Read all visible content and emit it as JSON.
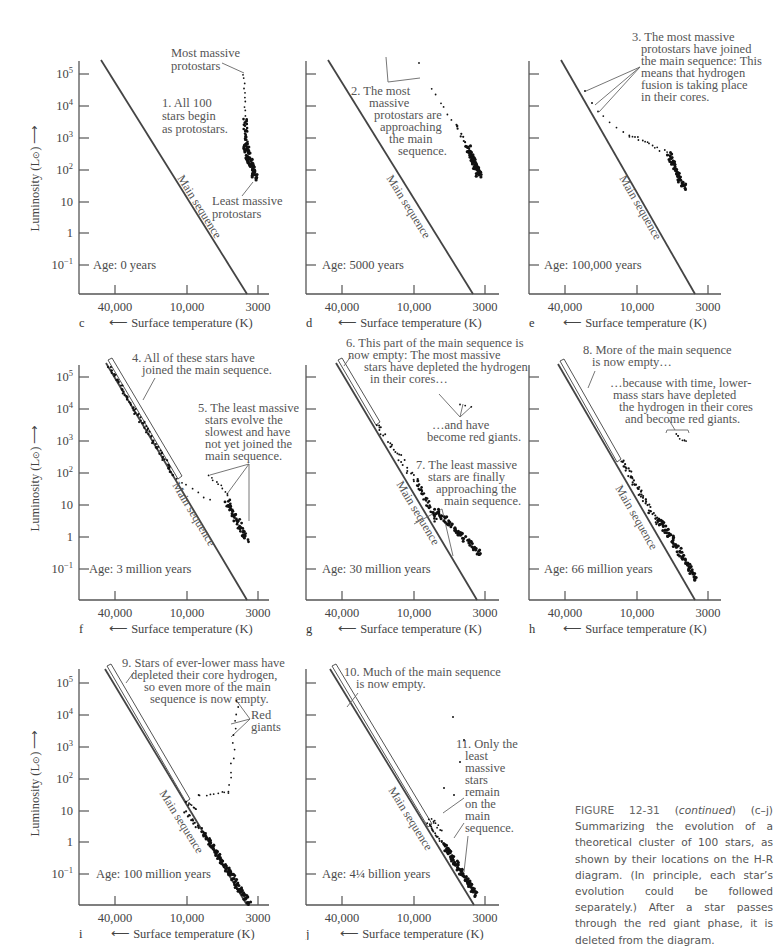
{
  "figure": {
    "caption": {
      "figure_number": "FIGURE 12-31",
      "continued": "continued",
      "text": "(c–j) Summarizing the evolution of a theoretical cluster of 100 stars, as shown by their locations on the H-R diagram. (In principle, each star’s evolution could be followed separately.) After a star passes through the red giant phase, it is deleted from the diagram."
    },
    "axes": {
      "y_label": "Luminosity (L⊙)",
      "x_label": "Surface temperature (K)",
      "y_ticks": [
        "10^5",
        "10^4",
        "10^3",
        "10^2",
        "10",
        "1",
        "10^-1"
      ],
      "x_ticks": [
        "40,000",
        "10,000",
        "3000"
      ],
      "main_sequence_label": "Main sequence"
    },
    "colors": {
      "ink": "#444444",
      "stars": "#111111",
      "text": "#4a4a4a",
      "background": "#ffffff"
    }
  },
  "chart_data": [
    {
      "panel": "c",
      "type": "scatter",
      "age": "Age: 0 years",
      "xlabel": "Surface temperature (K)",
      "ylabel": "Luminosity (L⊙)",
      "x_ticks": [
        40000,
        10000,
        3000
      ],
      "y_ticks": [
        100000,
        10000,
        1000,
        100,
        10,
        1,
        0.1
      ],
      "annotations": [
        "Most massive protostars",
        "1. All 100 stars begin as protostars.",
        "Least massive protostars"
      ],
      "stars_description": "vertical column near T≈3000 K from L≈100000 down to L≈50"
    },
    {
      "panel": "d",
      "type": "scatter",
      "age": "Age: 5000 years",
      "annotations": [
        "2. The most massive protostars are approaching the main sequence."
      ],
      "stars_description": "curve from T≈7000 K, L≈30000 descending to T≈2900 K, L≈60"
    },
    {
      "panel": "e",
      "type": "scatter",
      "age": "Age: 100,000 years",
      "annotations": [
        "3. The most massive protostars have joined the main sequence: This means that hydrogen fusion is taking place in their cores."
      ],
      "stars_description": "few stars on main sequence at L≈10^4; track across to T≈3000 K, L≈5"
    },
    {
      "panel": "f",
      "type": "scatter",
      "age": "Age: 3 million years",
      "annotations": [
        "4. All of these stars have joined the main sequence.",
        "5. The least massive stars evolve the slowest and have not yet joined the main sequence."
      ],
      "stars_description": "main sequence populated from L≈10^5 to ≈50; low-mass stars off MS down to L≈0.2"
    },
    {
      "panel": "g",
      "type": "scatter",
      "age": "Age: 30 million years",
      "annotations": [
        "6. This part of the main sequence is now empty: The most massive stars have depleted the hydrogen in their cores…",
        "…and have become red giants.",
        "7. The least massive stars are finally approaching the main sequence."
      ],
      "stars_description": "upper MS empty above L≈3000; few red giants; MS populated down to L≈0.2"
    },
    {
      "panel": "h",
      "type": "scatter",
      "age": "Age: 66 million years",
      "annotations": [
        "8. More of the main sequence is now empty…",
        "…because with time, lower-mass stars have depleted the hydrogen in their cores and become red giants."
      ],
      "stars_description": "MS empty above L≈200; red giants cluster near L≈50"
    },
    {
      "panel": "i",
      "type": "scatter",
      "age": "Age: 100 million years",
      "annotations": [
        "9. Stars of ever-lower mass have depleted their core hydrogen, so even more of the main sequence is now empty.",
        "Red giants"
      ],
      "stars_description": "MS empty above L≈20; giant branch rising to L≈2000 near T≈3500 K"
    },
    {
      "panel": "j",
      "type": "scatter",
      "age": "Age: 4¼ billion years",
      "annotations": [
        "10. Much of the main sequence is now empty.",
        "11. Only the least massive stars remain on the main sequence."
      ],
      "stars_description": "MS occupied only below L≈1; scattered giants"
    }
  ],
  "panels": {
    "c": {
      "letter": "c",
      "age": "Age: 0 years",
      "notes": [
        "Most massive",
        "protostars",
        "1. All 100",
        "stars begin",
        "as protostars.",
        "Least massive",
        "protostars"
      ]
    },
    "d": {
      "letter": "d",
      "age": "Age: 5000 years",
      "notes": [
        "2. The most",
        "massive",
        "protostars are",
        "approaching",
        "the main",
        "sequence."
      ]
    },
    "e": {
      "letter": "e",
      "age": "Age: 100,000 years",
      "notes": [
        "3. The most massive",
        "protostars have joined",
        "the main sequence: This",
        "means that hydrogen",
        "fusion is taking place",
        "in their cores."
      ]
    },
    "f": {
      "letter": "f",
      "age": "Age: 3 million years",
      "notes": [
        "4. All of these stars have",
        "joined the main sequence.",
        "5. The least massive",
        "stars evolve the",
        "slowest and have",
        "not yet joined the",
        "main sequence."
      ]
    },
    "g": {
      "letter": "g",
      "age": "Age: 30 million years",
      "notes": [
        "6. This part of the main sequence is",
        "now empty: The most massive",
        "stars have depleted the hydrogen",
        "in their cores…",
        "…and have",
        "become red giants.",
        "7. The least massive",
        "stars are finally",
        "approaching the",
        "main sequence."
      ]
    },
    "h": {
      "letter": "h",
      "age": "Age: 66 million years",
      "notes": [
        "8. More of the main sequence",
        "is now empty…",
        "…because with time, lower-",
        "mass stars have depleted",
        "the hydrogen in their cores",
        "and become red giants."
      ]
    },
    "i": {
      "letter": "i",
      "age": "Age: 100 million years",
      "notes": [
        "9. Stars of ever-lower mass have",
        "depleted their core hydrogen,",
        "so even more of the main",
        "sequence is now empty.",
        "Red",
        "giants"
      ]
    },
    "j": {
      "letter": "j",
      "age": "Age: 4¼  billion years",
      "notes": [
        "10. Much of the main sequence",
        "is now empty.",
        "11. Only the",
        "least",
        "massive",
        "stars",
        "remain",
        "on the",
        "main",
        "sequence."
      ]
    }
  }
}
